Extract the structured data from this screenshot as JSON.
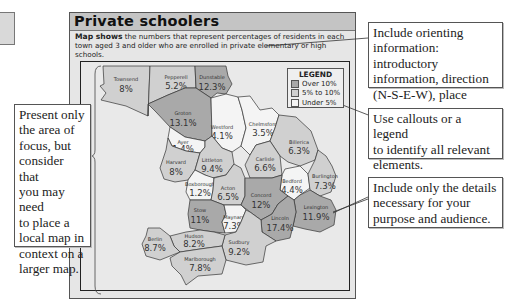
{
  "panel": {
    "title": "Private schoolers",
    "intro_bold": "Map shows",
    "intro_text": " the numbers that represent percentages of residents in each town aged 3 and older who are enrolled in private elementary or high schools."
  },
  "legend": {
    "title": "LEGEND",
    "items": [
      {
        "label": "Over 10%",
        "color": "#a9a9a9"
      },
      {
        "label": "5% to 10%",
        "color": "#d0d0d0"
      },
      {
        "label": "Under 5%",
        "color": "#f4f4f4"
      }
    ]
  },
  "towns": [
    {
      "name": "Townsend",
      "value": "8%",
      "category": "5% to 10%"
    },
    {
      "name": "Pepperell",
      "value": "5.2%",
      "category": "5% to 10%"
    },
    {
      "name": "Dunstable",
      "value": "12.3%",
      "category": "Over 10%"
    },
    {
      "name": "Groton",
      "value": "13.1%",
      "category": "Over 10%"
    },
    {
      "name": "Westford",
      "value": "4.1%",
      "category": "Under 5%"
    },
    {
      "name": "Chelmsford",
      "value": "3.5%",
      "category": "Under 5%"
    },
    {
      "name": "Billerica",
      "value": "6.3%",
      "category": "5% to 10%"
    },
    {
      "name": "Ayer",
      "value": "1.4%",
      "category": "Under 5%"
    },
    {
      "name": "Harvard",
      "value": "8%",
      "category": "5% to 10%"
    },
    {
      "name": "Littleton",
      "value": "9.4%",
      "category": "5% to 10%"
    },
    {
      "name": "Carlisle",
      "value": "6.6%",
      "category": "5% to 10%"
    },
    {
      "name": "Bedford",
      "value": "4.4%",
      "category": "Under 5%"
    },
    {
      "name": "Burlington",
      "value": "7.3%",
      "category": "5% to 10%"
    },
    {
      "name": "Boxborough",
      "value": "1.2%",
      "category": "Under 5%"
    },
    {
      "name": "Acton",
      "value": "6.5%",
      "category": "5% to 10%"
    },
    {
      "name": "Concord",
      "value": "12%",
      "category": "Over 10%"
    },
    {
      "name": "Lexington",
      "value": "11.9%",
      "category": "Over 10%"
    },
    {
      "name": "Stow",
      "value": "11%",
      "category": "Over 10%"
    },
    {
      "name": "Maynard",
      "value": "7.3%",
      "category": "5% to 10%"
    },
    {
      "name": "Lincoln",
      "value": "17.4%",
      "category": "Over 10%"
    },
    {
      "name": "Sudbury",
      "value": "9.2%",
      "category": "5% to 10%"
    },
    {
      "name": "Hudson",
      "value": "8.2%",
      "category": "5% to 10%"
    },
    {
      "name": "Berlin",
      "value": "8.7%",
      "category": "5% to 10%"
    },
    {
      "name": "Marlborough",
      "value": "7.8%",
      "category": "5% to 10%"
    }
  ],
  "callouts": {
    "left": "Present only\nthe area of\nfocus, but\nconsider that\nyou may need\nto place a\nlocal map in\ncontext on a\nlarger map.",
    "orienting": "Include orienting\ninformation: introductory\ninformation, direction\n(N-S-E-W), place names.",
    "legend": "Use callouts or a legend\nto identify all relevant\nelements.",
    "details": "Include only the details\nnecessary for your\npurpose and audience."
  }
}
